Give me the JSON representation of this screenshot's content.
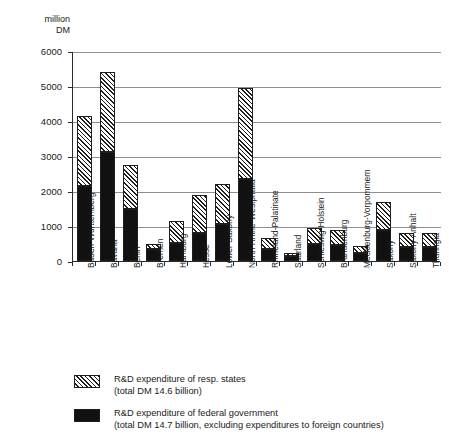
{
  "chart_data": {
    "type": "bar",
    "title": "",
    "subtitle": "",
    "xlabel": "",
    "ylabel": "million DM",
    "unit_caption": "million\nDM",
    "ylim": [
      0,
      6000
    ],
    "yticks": [
      0,
      1000,
      2000,
      3000,
      4000,
      5000,
      6000
    ],
    "ytick_labels": [
      "0",
      "1000",
      "2000",
      "3000",
      "4000",
      "5000",
      "6000"
    ],
    "grid": true,
    "stacked": true,
    "legend_position": "bottom",
    "categories": [
      "Baden-Württemberg",
      "Bavaria",
      "Berlin",
      "Bremen",
      "Hamburg",
      "Hesse",
      "Lower Saxony",
      "North Rhine-Westphalia",
      "Rhineland-Palatinate",
      "Saarland",
      "Schleswig-Holstein",
      "Brandenburg",
      "Mecklenburg-Vorpommern",
      "Saxony",
      "Saxony-Anhalt",
      "Thuringia"
    ],
    "series": [
      {
        "name": "R&D expenditure of federal government",
        "color": "#111111",
        "pattern": "solid",
        "values": [
          2150,
          3120,
          1500,
          330,
          520,
          800,
          1060,
          2350,
          330,
          130,
          490,
          450,
          230,
          900,
          400,
          400
        ]
      },
      {
        "name": "R&D expenditure of resp. states",
        "color": "#ffffff",
        "pattern": "diagonal-hatch",
        "values": [
          2000,
          2280,
          1250,
          160,
          630,
          1100,
          1140,
          2600,
          320,
          100,
          440,
          450,
          190,
          780,
          400,
          400
        ]
      }
    ],
    "totals": [
      4150,
      5400,
      2750,
      490,
      1150,
      1900,
      2200,
      4950,
      650,
      230,
      930,
      900,
      420,
      1680,
      800,
      800
    ],
    "annotations": []
  },
  "legend": {
    "items": [
      {
        "swatch": "diagonal-hatch",
        "label": "R&D expenditure of resp. states",
        "sub": "(total DM 14.6 billion)"
      },
      {
        "swatch": "solid-black",
        "label": "R&D expenditure of federal government",
        "sub": "(total DM 14.7 billion, excluding expenditures to foreign countries)"
      }
    ]
  }
}
